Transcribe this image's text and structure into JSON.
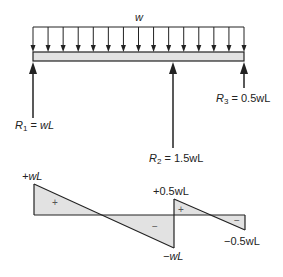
{
  "diagram": {
    "load": {
      "label": "w",
      "arrow_count": 15,
      "x_start": 33,
      "x_end": 244
    },
    "beam": {
      "x_start": 33,
      "x_end": 244,
      "y_top": 52,
      "y_bottom": 61,
      "fill": "#e2e2e2"
    },
    "reactions": [
      {
        "id": "R1",
        "sym": "R",
        "sub": "1",
        "eq": " = ",
        "value": "wL",
        "x": 33,
        "y_tip": 62,
        "y_tail": 118
      },
      {
        "id": "R2",
        "sym": "R",
        "sub": "2",
        "eq": " = ",
        "value": "1.5wL",
        "x": 173,
        "y_tip": 62,
        "y_tail": 148
      },
      {
        "id": "R3",
        "sym": "R",
        "sub": "3",
        "eq": " = ",
        "value": "0.5wL",
        "x": 244,
        "y_tip": 62,
        "y_tail": 88
      }
    ],
    "shear_diagram": {
      "baseline_y": 215,
      "fill": "#e2e2e2",
      "labels": {
        "left_max": "+wL",
        "mid_min": "−wL",
        "right_max": "+0.5wL",
        "right_min": "−0.5wL"
      },
      "signs": {
        "plus": "+",
        "minus": "−"
      },
      "segments": [
        {
          "x0": 34,
          "v0": "+wL",
          "x1": 174,
          "v1": "-wL",
          "zero_x": 101
        },
        {
          "x0": 174,
          "v0": "+0.5wL",
          "x1": 245,
          "v1": "-0.5wL",
          "zero_x": 208
        }
      ]
    }
  }
}
